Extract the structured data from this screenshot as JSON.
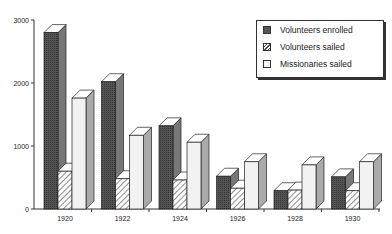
{
  "chart_data": {
    "type": "bar",
    "style": "3d-grouped",
    "title": "",
    "xlabel": "",
    "ylabel": "",
    "categories": [
      "1920",
      "1922",
      "1924",
      "1926",
      "1928",
      "1930"
    ],
    "series": [
      {
        "name": "Volunteers enrolled",
        "fill": "dark-stipple",
        "values": [
          2800,
          2020,
          1320,
          520,
          290,
          510
        ]
      },
      {
        "name": "Volunteers sailed",
        "fill": "hatched",
        "values": [
          600,
          480,
          460,
          330,
          300,
          290
        ]
      },
      {
        "name": "Missionaries sailed",
        "fill": "light",
        "values": [
          1760,
          1170,
          1060,
          750,
          700,
          750
        ]
      }
    ],
    "yticks": [
      0,
      1000,
      2000,
      3000
    ],
    "ylim": [
      0,
      3000
    ],
    "grid": false,
    "legend_position": "top-right"
  },
  "legend": {
    "items": [
      {
        "label": "Volunteers enrolled"
      },
      {
        "label": "Volunteers sailed"
      },
      {
        "label": "Missionaries sailed"
      }
    ]
  },
  "colors": {
    "enrolled": "#4a4a4a",
    "sailed": "#ffffff",
    "missionaries": "#f2f2f2",
    "axis": "#333333"
  }
}
